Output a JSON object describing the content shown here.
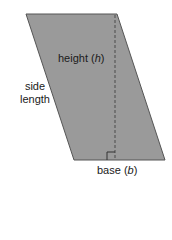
{
  "diagram": {
    "shape": "parallelogram",
    "fill_color": "#9a9a9a",
    "edge_color": "#555555",
    "vertices": [
      [
        26,
        14
      ],
      [
        117,
        14
      ],
      [
        165,
        160
      ],
      [
        74,
        160
      ]
    ],
    "height_line": {
      "x": 115,
      "y1": 14,
      "y2": 160,
      "style": "dashed"
    },
    "right_angle_marker": {
      "x": 107,
      "y": 152,
      "size": 8
    },
    "labels": {
      "height": {
        "text": "height",
        "var": "h"
      },
      "side": {
        "line1": "side",
        "line2": "length"
      },
      "base": {
        "text": "base",
        "var": "b"
      }
    }
  }
}
